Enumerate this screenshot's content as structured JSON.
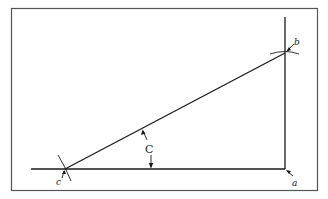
{
  "diagram": {
    "type": "geometric-construction",
    "labels": {
      "a": "a",
      "b": "b",
      "c": "c",
      "angle": "C"
    },
    "colors": {
      "stroke": "#1a1a1a",
      "frame": "#555555",
      "background": "#ffffff"
    }
  }
}
